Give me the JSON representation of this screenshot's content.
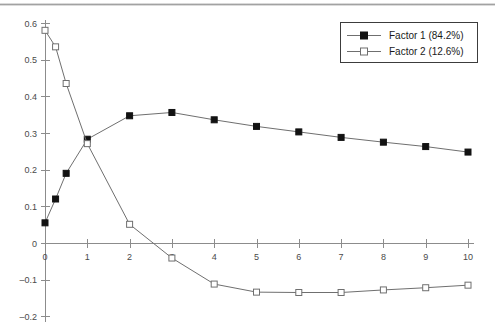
{
  "chart_data": {
    "type": "line",
    "title": "",
    "subtitle": "",
    "xlabel": "",
    "ylabel": "",
    "xlim": [
      0,
      10
    ],
    "ylim": [
      -0.2,
      0.6
    ],
    "xticks": [
      0,
      1,
      2,
      3,
      4,
      5,
      6,
      7,
      8,
      9,
      10
    ],
    "xtick_labels": [
      "0",
      "1",
      "2",
      "3",
      "4",
      "5",
      "6",
      "7",
      "8",
      "9",
      "10"
    ],
    "yticks": [
      -0.2,
      -0.1,
      0,
      0.1,
      0.2,
      0.3,
      0.4,
      0.5,
      0.6
    ],
    "ytick_labels": [
      "–0.2",
      "–0.1",
      "0",
      "0.1",
      "0.2",
      "0.3",
      "0.4",
      "0.5",
      "0.6"
    ],
    "grid": false,
    "legend_position": "top-right",
    "series": [
      {
        "name": "Factor 1 (84.2%)",
        "marker": "filled-square",
        "color": "#121212",
        "line_color": "#6f6f6f",
        "x": [
          0,
          0.25,
          0.5,
          1,
          2,
          3,
          4,
          5,
          6,
          7,
          8,
          9,
          10
        ],
        "values": [
          0.055,
          0.12,
          0.19,
          0.283,
          0.347,
          0.356,
          0.336,
          0.318,
          0.303,
          0.288,
          0.275,
          0.263,
          0.248
        ]
      },
      {
        "name": "Factor 2 (12.6%)",
        "marker": "open-square",
        "color": "#ffffff",
        "line_color": "#6f6f6f",
        "x": [
          0,
          0.25,
          0.5,
          1,
          2,
          3,
          4,
          5,
          6,
          7,
          8,
          9,
          10
        ],
        "values": [
          0.58,
          0.535,
          0.435,
          0.271,
          0.051,
          -0.041,
          -0.112,
          -0.134,
          -0.135,
          -0.135,
          -0.128,
          -0.122,
          -0.115
        ]
      }
    ]
  },
  "legend": {
    "entries": [
      {
        "label": "Factor 1 (84.2%)",
        "marker": "filled-square"
      },
      {
        "label": "Factor 2 (12.6%)",
        "marker": "open-square"
      }
    ]
  },
  "colors": {
    "axis": "#8c8c8c",
    "line": "#6f6f6f",
    "filled_marker": "#121212",
    "open_marker_fill": "#ffffff",
    "text": "#1a1a1a",
    "background": "#ffffff"
  }
}
